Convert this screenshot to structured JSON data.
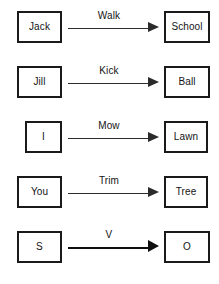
{
  "diagram": {
    "type": "flow",
    "title": "",
    "background_color": "#ffffff",
    "node_border_color": "#1a1a1a",
    "edge_color": "#2b2b2b",
    "text_color": "#141414",
    "rows": [
      {
        "source": "Jack",
        "edge_label": "Walk",
        "target": "School",
        "source_width": "wide",
        "emphasis": "normal"
      },
      {
        "source": "Jill",
        "edge_label": "Kick",
        "target": "Ball",
        "source_width": "wide",
        "emphasis": "normal"
      },
      {
        "source": "I",
        "edge_label": "Mow",
        "target": "Lawn",
        "source_width": "narrow",
        "emphasis": "normal"
      },
      {
        "source": "You",
        "edge_label": "Trim",
        "target": "Tree",
        "source_width": "wide",
        "emphasis": "normal"
      },
      {
        "source": "S",
        "edge_label": "V",
        "target": "O",
        "source_width": "wide",
        "emphasis": "bold"
      }
    ]
  }
}
